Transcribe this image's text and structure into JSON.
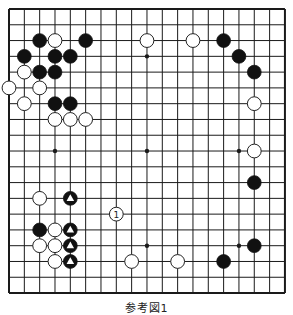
{
  "diagram": {
    "type": "go-board",
    "size": 19,
    "caption": "参考図1",
    "colors": {
      "background": "#ffffff",
      "grid": "#1a1a1a",
      "black_stone": "#111111",
      "white_stone": "#ffffff",
      "stone_outline": "#222222"
    },
    "star_points": [
      [
        3,
        3
      ],
      [
        9,
        3
      ],
      [
        15,
        3
      ],
      [
        3,
        9
      ],
      [
        9,
        9
      ],
      [
        15,
        9
      ],
      [
        3,
        15
      ],
      [
        9,
        15
      ],
      [
        15,
        15
      ]
    ],
    "stones": [
      {
        "col": 2,
        "row": 2,
        "color": "black"
      },
      {
        "col": 5,
        "row": 2,
        "color": "black"
      },
      {
        "col": 14,
        "row": 2,
        "color": "black"
      },
      {
        "col": 1,
        "row": 3,
        "color": "black"
      },
      {
        "col": 3,
        "row": 3,
        "color": "black"
      },
      {
        "col": 4,
        "row": 3,
        "color": "black"
      },
      {
        "col": 15,
        "row": 3,
        "color": "black"
      },
      {
        "col": 2,
        "row": 4,
        "color": "black"
      },
      {
        "col": 3,
        "row": 4,
        "color": "black"
      },
      {
        "col": 16,
        "row": 4,
        "color": "black"
      },
      {
        "col": 3,
        "row": 6,
        "color": "black"
      },
      {
        "col": 4,
        "row": 6,
        "color": "black"
      },
      {
        "col": 16,
        "row": 11,
        "color": "black"
      },
      {
        "col": 2,
        "row": 14,
        "color": "black"
      },
      {
        "col": 16,
        "row": 15,
        "color": "black"
      },
      {
        "col": 14,
        "row": 16,
        "color": "black"
      },
      {
        "col": 4,
        "row": 12,
        "color": "black",
        "mark": "triangle"
      },
      {
        "col": 4,
        "row": 14,
        "color": "black",
        "mark": "triangle"
      },
      {
        "col": 4,
        "row": 15,
        "color": "black",
        "mark": "triangle"
      },
      {
        "col": 4,
        "row": 16,
        "color": "black",
        "mark": "triangle"
      },
      {
        "col": 3,
        "row": 2,
        "color": "white"
      },
      {
        "col": 9,
        "row": 2,
        "color": "white"
      },
      {
        "col": 12,
        "row": 2,
        "color": "white"
      },
      {
        "col": 1,
        "row": 4,
        "color": "white"
      },
      {
        "col": 0,
        "row": 5,
        "color": "white"
      },
      {
        "col": 2,
        "row": 5,
        "color": "white"
      },
      {
        "col": 1,
        "row": 6,
        "color": "white"
      },
      {
        "col": 16,
        "row": 6,
        "color": "white"
      },
      {
        "col": 3,
        "row": 7,
        "color": "white"
      },
      {
        "col": 4,
        "row": 7,
        "color": "white"
      },
      {
        "col": 5,
        "row": 7,
        "color": "white"
      },
      {
        "col": 16,
        "row": 9,
        "color": "white"
      },
      {
        "col": 2,
        "row": 12,
        "color": "white"
      },
      {
        "col": 3,
        "row": 14,
        "color": "white"
      },
      {
        "col": 2,
        "row": 15,
        "color": "white"
      },
      {
        "col": 3,
        "row": 15,
        "color": "white"
      },
      {
        "col": 3,
        "row": 16,
        "color": "white"
      },
      {
        "col": 8,
        "row": 16,
        "color": "white"
      },
      {
        "col": 11,
        "row": 16,
        "color": "white"
      },
      {
        "col": 7,
        "row": 13,
        "color": "white",
        "label": "1"
      }
    ]
  },
  "geometry": {
    "x0": 9,
    "y0": 9,
    "dx": 15.33,
    "dy": 15.78,
    "stone_r": 6.9
  }
}
